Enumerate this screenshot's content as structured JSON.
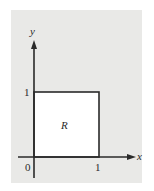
{
  "figure": {
    "region_label": "R",
    "x_axis_label": "x",
    "y_axis_label": "y",
    "origin_label": "0",
    "x_tick_label": "1",
    "y_tick_label": "1"
  },
  "colors": {
    "background_panel": "#e9e9e7",
    "region_fill": "#ffffff",
    "stroke": "#2a2a2a"
  },
  "geometry": {
    "region": "unit square [0,1] x [0,1]"
  }
}
